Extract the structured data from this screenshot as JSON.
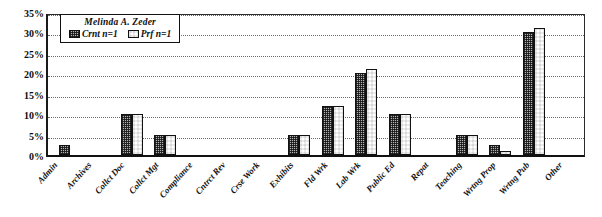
{
  "chart_data": {
    "type": "bar",
    "title": "Melinda A. Zeder",
    "xlabel": "",
    "ylabel": "",
    "ylim": [
      0,
      35
    ],
    "ytick_labels": [
      "35%",
      "30%",
      "25%",
      "20%",
      "15%",
      "10%",
      "5%",
      "0%"
    ],
    "ytick_values": [
      35,
      30,
      25,
      20,
      15,
      10,
      5,
      0
    ],
    "grid": true,
    "legend_position": "top-left-inside",
    "categories": [
      "Admin",
      "Archives",
      "Collct Doc",
      "Collct Mgt",
      "Compliance",
      "Cntrct Rev",
      "Crse Work",
      "Exhibits",
      "Fld Wrk",
      "Lab Wrk",
      "Public Ed",
      "Repat",
      "Teaching",
      "Wrtng Prop",
      "Wrtng Pub",
      "Other"
    ],
    "series": [
      {
        "name": "Crnt n=1",
        "pattern": "fine-checker-grey",
        "values": [
          2.5,
          0,
          10,
          5,
          0,
          0,
          0,
          5,
          12,
          20,
          10,
          0,
          5,
          2.5,
          30,
          0
        ]
      },
      {
        "name": "Prf n=1",
        "pattern": "coarse-checker",
        "values": [
          0,
          0,
          10,
          5,
          0,
          0,
          0,
          5,
          12,
          21,
          10,
          0,
          5,
          1,
          31,
          0
        ]
      }
    ]
  },
  "legend": {
    "title": "Melinda A. Zeder",
    "entries": [
      {
        "label": "Crnt n=1"
      },
      {
        "label": "Prf n=1"
      }
    ]
  },
  "colors": {
    "axis": "#111111",
    "gridline": "#6b6b6b",
    "bar_crnt": "#b4b4b4",
    "bar_prf": "#ffffff",
    "background": "#ffffff"
  }
}
